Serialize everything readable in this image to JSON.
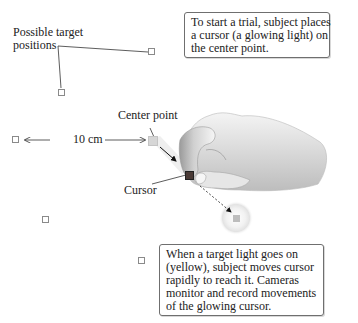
{
  "labels": {
    "possible_targets_line1": "Possible target",
    "possible_targets_line2": "positions",
    "center_point": "Center point",
    "distance": "10 cm",
    "cursor": "Cursor"
  },
  "callouts": {
    "start": {
      "lines": [
        "To start a trial, subject places",
        "a cursor (a glowing light) on",
        "the center point."
      ]
    },
    "target": {
      "lines": [
        "When a target light goes on",
        "(yellow), subject moves cursor",
        "rapidly to reach it. Cameras",
        "monitor and record movements",
        "of the glowing cursor."
      ]
    }
  },
  "colors": {
    "target_outline": "#8a8a8a",
    "center_point": "#d6d6d6",
    "cursor": "#4a3a36",
    "lit_target": "#bdbdbd",
    "glow": "#e4e4e4"
  }
}
